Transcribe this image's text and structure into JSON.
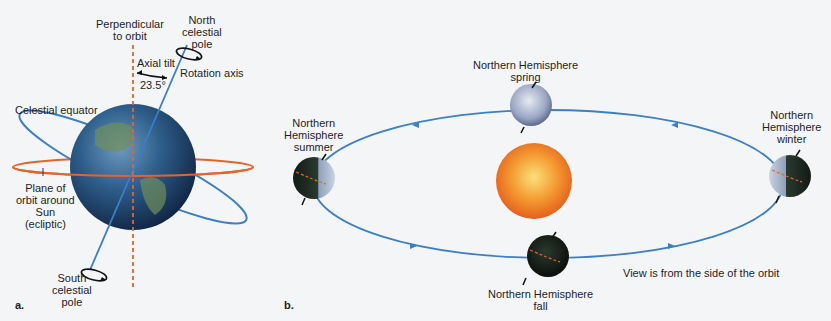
{
  "panel_a": {
    "letter": "a.",
    "labels": {
      "perpendicular": [
        "Perpendicular",
        "to orbit"
      ],
      "north_pole": [
        "North",
        "celestial",
        "pole"
      ],
      "axial_tilt": "Axial tilt",
      "tilt_angle": "23.5°",
      "rotation_axis": "Rotation axis",
      "celestial_equator": "Celestial equator",
      "plane_of_orbit": [
        "Plane of",
        "orbit around",
        "Sun",
        "(ecliptic)"
      ],
      "south_pole": [
        "South",
        "celestial",
        "pole"
      ]
    }
  },
  "panel_b": {
    "letter": "b.",
    "labels": {
      "spring": [
        "Northern Hemisphere",
        "spring"
      ],
      "summer": [
        "Northern",
        "Hemisphere",
        "summer"
      ],
      "winter": [
        "Northern",
        "Hemisphere",
        "winter"
      ],
      "fall": [
        "Northern Hemisphere",
        "fall"
      ],
      "view_note": "View is from the side of the orbit"
    }
  },
  "colors": {
    "orbit_blue": "#3b7fc4",
    "ecliptic_orange": "#e0662e",
    "sun_orange": "#f07a24",
    "earth_blue": "#2d5a8a"
  }
}
